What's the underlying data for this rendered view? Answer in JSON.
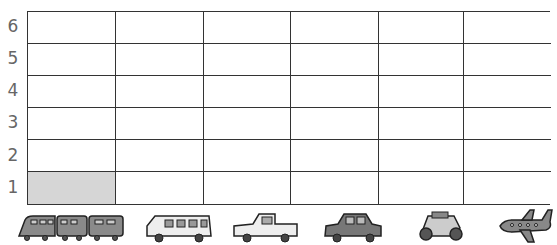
{
  "chart_data": {
    "type": "bar",
    "title": "",
    "xlabel": "",
    "ylabel": "",
    "ylim": [
      0,
      6
    ],
    "y_ticks": [
      "1",
      "2",
      "3",
      "4",
      "5",
      "6"
    ],
    "categories": [
      "train",
      "van",
      "pickup truck",
      "car",
      "motorcycle",
      "airplane"
    ],
    "values": [
      1,
      0,
      0,
      0,
      0,
      0
    ],
    "grid": true,
    "note": "Pictograph grid; one cell shaded for train at level 1"
  },
  "colors": {
    "fill": "#d6d6d6",
    "line": "#333333",
    "label": "#666666"
  }
}
